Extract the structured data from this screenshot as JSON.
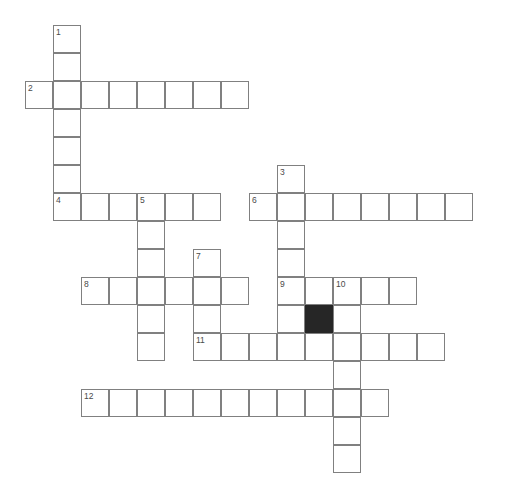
{
  "puzzle": {
    "title": "Crossword Puzzle Grid",
    "grid": {
      "cell_size": 28,
      "origin_x": 25,
      "origin_y": 25,
      "columns": 17,
      "rows": 17,
      "line_color": "#808080",
      "cell_color": "#ffffff",
      "block_color": "#262626",
      "number_color": "#4a4a4a",
      "background": "#ffffff"
    },
    "entries": [
      {
        "number": "1",
        "direction": "down",
        "col": 1,
        "row": 0,
        "length": 7
      },
      {
        "number": "2",
        "direction": "across",
        "col": 0,
        "row": 2,
        "length": 8
      },
      {
        "number": "3",
        "direction": "down",
        "col": 9,
        "row": 5,
        "length": 7
      },
      {
        "number": "4",
        "direction": "across",
        "col": 1,
        "row": 6,
        "length": 6
      },
      {
        "number": "5",
        "direction": "down",
        "col": 4,
        "row": 6,
        "length": 6
      },
      {
        "number": "6",
        "direction": "across",
        "col": 8,
        "row": 6,
        "length": 8
      },
      {
        "number": "7",
        "direction": "down",
        "col": 6,
        "row": 8,
        "length": 4
      },
      {
        "number": "8",
        "direction": "across",
        "col": 2,
        "row": 9,
        "length": 6
      },
      {
        "number": "9",
        "direction": "across",
        "col": 9,
        "row": 9,
        "length": 6
      },
      {
        "number": "10",
        "direction": "down",
        "col": 11,
        "row": 9,
        "length": 7
      },
      {
        "number": "11",
        "direction": "across",
        "col": 6,
        "row": 11,
        "length": 9
      },
      {
        "number": "12",
        "direction": "across",
        "col": 2,
        "row": 13,
        "length": 11
      }
    ],
    "cells": [
      {
        "col": 1,
        "row": 0,
        "number": "1",
        "letter": "",
        "block": false
      },
      {
        "col": 1,
        "row": 1,
        "number": "",
        "letter": "",
        "block": false
      },
      {
        "col": 0,
        "row": 2,
        "number": "2",
        "letter": "",
        "block": false
      },
      {
        "col": 1,
        "row": 2,
        "number": "",
        "letter": "",
        "block": false
      },
      {
        "col": 2,
        "row": 2,
        "number": "",
        "letter": "",
        "block": false
      },
      {
        "col": 3,
        "row": 2,
        "number": "",
        "letter": "",
        "block": false
      },
      {
        "col": 4,
        "row": 2,
        "number": "",
        "letter": "",
        "block": false
      },
      {
        "col": 5,
        "row": 2,
        "number": "",
        "letter": "",
        "block": false
      },
      {
        "col": 6,
        "row": 2,
        "number": "",
        "letter": "",
        "block": false
      },
      {
        "col": 7,
        "row": 2,
        "number": "",
        "letter": "",
        "block": false
      },
      {
        "col": 1,
        "row": 3,
        "number": "",
        "letter": "",
        "block": false
      },
      {
        "col": 1,
        "row": 4,
        "number": "",
        "letter": "",
        "block": false
      },
      {
        "col": 1,
        "row": 5,
        "number": "",
        "letter": "",
        "block": false
      },
      {
        "col": 9,
        "row": 5,
        "number": "3",
        "letter": "",
        "block": false
      },
      {
        "col": 1,
        "row": 6,
        "number": "4",
        "letter": "",
        "block": false
      },
      {
        "col": 2,
        "row": 6,
        "number": "",
        "letter": "",
        "block": false
      },
      {
        "col": 3,
        "row": 6,
        "number": "",
        "letter": "",
        "block": false
      },
      {
        "col": 4,
        "row": 6,
        "number": "5",
        "letter": "",
        "block": false
      },
      {
        "col": 5,
        "row": 6,
        "number": "",
        "letter": "",
        "block": false
      },
      {
        "col": 6,
        "row": 6,
        "number": "",
        "letter": "",
        "block": false
      },
      {
        "col": 8,
        "row": 6,
        "number": "6",
        "letter": "",
        "block": false
      },
      {
        "col": 9,
        "row": 6,
        "number": "",
        "letter": "",
        "block": false
      },
      {
        "col": 10,
        "row": 6,
        "number": "",
        "letter": "",
        "block": false
      },
      {
        "col": 11,
        "row": 6,
        "number": "",
        "letter": "",
        "block": false
      },
      {
        "col": 12,
        "row": 6,
        "number": "",
        "letter": "",
        "block": false
      },
      {
        "col": 13,
        "row": 6,
        "number": "",
        "letter": "",
        "block": false
      },
      {
        "col": 14,
        "row": 6,
        "number": "",
        "letter": "",
        "block": false
      },
      {
        "col": 15,
        "row": 6,
        "number": "",
        "letter": "",
        "block": false
      },
      {
        "col": 4,
        "row": 7,
        "number": "",
        "letter": "",
        "block": false
      },
      {
        "col": 9,
        "row": 7,
        "number": "",
        "letter": "",
        "block": false
      },
      {
        "col": 4,
        "row": 8,
        "number": "",
        "letter": "",
        "block": false
      },
      {
        "col": 6,
        "row": 8,
        "number": "7",
        "letter": "",
        "block": false
      },
      {
        "col": 9,
        "row": 8,
        "number": "",
        "letter": "",
        "block": false
      },
      {
        "col": 2,
        "row": 9,
        "number": "8",
        "letter": "",
        "block": false
      },
      {
        "col": 3,
        "row": 9,
        "number": "",
        "letter": "",
        "block": false
      },
      {
        "col": 4,
        "row": 9,
        "number": "",
        "letter": "",
        "block": false
      },
      {
        "col": 5,
        "row": 9,
        "number": "",
        "letter": "",
        "block": false
      },
      {
        "col": 6,
        "row": 9,
        "number": "",
        "letter": "",
        "block": false
      },
      {
        "col": 7,
        "row": 9,
        "number": "",
        "letter": "",
        "block": false
      },
      {
        "col": 9,
        "row": 9,
        "number": "9",
        "letter": "",
        "block": false
      },
      {
        "col": 10,
        "row": 9,
        "number": "",
        "letter": "",
        "block": false
      },
      {
        "col": 11,
        "row": 9,
        "number": "10",
        "letter": "",
        "block": false
      },
      {
        "col": 12,
        "row": 9,
        "number": "",
        "letter": "",
        "block": false
      },
      {
        "col": 13,
        "row": 9,
        "number": "",
        "letter": "",
        "block": false
      },
      {
        "col": 4,
        "row": 10,
        "number": "",
        "letter": "",
        "block": false
      },
      {
        "col": 6,
        "row": 10,
        "number": "",
        "letter": "",
        "block": false
      },
      {
        "col": 9,
        "row": 10,
        "number": "",
        "letter": "",
        "block": false
      },
      {
        "col": 10,
        "row": 10,
        "number": "",
        "letter": "",
        "block": true
      },
      {
        "col": 11,
        "row": 10,
        "number": "",
        "letter": "",
        "block": false
      },
      {
        "col": 4,
        "row": 11,
        "number": "",
        "letter": "",
        "block": false
      },
      {
        "col": 6,
        "row": 11,
        "number": "11",
        "letter": "",
        "block": false
      },
      {
        "col": 7,
        "row": 11,
        "number": "",
        "letter": "",
        "block": false
      },
      {
        "col": 8,
        "row": 11,
        "number": "",
        "letter": "",
        "block": false
      },
      {
        "col": 9,
        "row": 11,
        "number": "",
        "letter": "",
        "block": false
      },
      {
        "col": 10,
        "row": 11,
        "number": "",
        "letter": "",
        "block": false
      },
      {
        "col": 11,
        "row": 11,
        "number": "",
        "letter": "",
        "block": false
      },
      {
        "col": 12,
        "row": 11,
        "number": "",
        "letter": "",
        "block": false
      },
      {
        "col": 13,
        "row": 11,
        "number": "",
        "letter": "",
        "block": false
      },
      {
        "col": 14,
        "row": 11,
        "number": "",
        "letter": "",
        "block": false
      },
      {
        "col": 11,
        "row": 12,
        "number": "",
        "letter": "",
        "block": false
      },
      {
        "col": 2,
        "row": 13,
        "number": "12",
        "letter": "",
        "block": false
      },
      {
        "col": 3,
        "row": 13,
        "number": "",
        "letter": "",
        "block": false
      },
      {
        "col": 4,
        "row": 13,
        "number": "",
        "letter": "",
        "block": false
      },
      {
        "col": 5,
        "row": 13,
        "number": "",
        "letter": "",
        "block": false
      },
      {
        "col": 6,
        "row": 13,
        "number": "",
        "letter": "",
        "block": false
      },
      {
        "col": 7,
        "row": 13,
        "number": "",
        "letter": "",
        "block": false
      },
      {
        "col": 8,
        "row": 13,
        "number": "",
        "letter": "",
        "block": false
      },
      {
        "col": 9,
        "row": 13,
        "number": "",
        "letter": "",
        "block": false
      },
      {
        "col": 10,
        "row": 13,
        "number": "",
        "letter": "",
        "block": false
      },
      {
        "col": 11,
        "row": 13,
        "number": "",
        "letter": "",
        "block": false
      },
      {
        "col": 12,
        "row": 13,
        "number": "",
        "letter": "",
        "block": false
      },
      {
        "col": 11,
        "row": 14,
        "number": "",
        "letter": "",
        "block": false
      },
      {
        "col": 11,
        "row": 15,
        "number": "",
        "letter": "",
        "block": false
      }
    ]
  }
}
